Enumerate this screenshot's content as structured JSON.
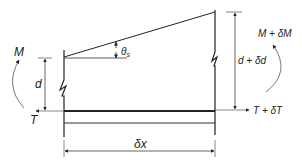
{
  "diagram": {
    "labels": {
      "moment_left": "M",
      "tension_left": "T",
      "depth_left": "d",
      "angle": "θ",
      "angle_sub": "s",
      "moment_right": "M + δM",
      "tension_right": "T + δT",
      "depth_right": "d + δd",
      "length": "δx"
    },
    "colors": {
      "line": "#222222",
      "thin_line": "#555555",
      "background": "#ffffff"
    }
  }
}
